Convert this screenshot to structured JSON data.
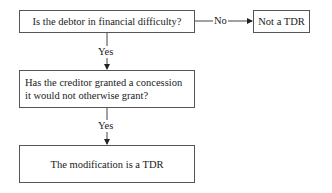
{
  "diagram": {
    "type": "flowchart",
    "nodes": [
      {
        "id": "q1",
        "text": "Is the debtor in financial difficulty?"
      },
      {
        "id": "no_tdr",
        "text": "Not a TDR"
      },
      {
        "id": "q2",
        "text": "Has the creditor granted a concession it would not otherwise grant?"
      },
      {
        "id": "tdr",
        "text": "The modification is a TDR"
      }
    ],
    "edges": [
      {
        "from": "q1",
        "to": "no_tdr",
        "label": "No"
      },
      {
        "from": "q1",
        "to": "q2",
        "label": "Yes"
      },
      {
        "from": "q2",
        "to": "tdr",
        "label": "Yes"
      }
    ]
  }
}
